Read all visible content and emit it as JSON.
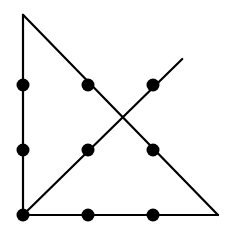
{
  "diagram": {
    "grid": {
      "rows": 3,
      "cols": 3
    },
    "dots": [
      {
        "row": 0,
        "col": 0
      },
      {
        "row": 0,
        "col": 1
      },
      {
        "row": 0,
        "col": 2
      },
      {
        "row": 1,
        "col": 0
      },
      {
        "row": 1,
        "col": 1
      },
      {
        "row": 1,
        "col": 2
      },
      {
        "row": 2,
        "col": 0
      },
      {
        "row": 2,
        "col": 1
      },
      {
        "row": 2,
        "col": 2
      }
    ],
    "path_in_grid_units": [
      {
        "col": 2.45,
        "row": -0.4
      },
      {
        "col": 0,
        "row": 2
      },
      {
        "col": 3.0,
        "row": 2
      },
      {
        "col": 0,
        "row": -1.08
      },
      {
        "col": 0,
        "row": 2
      }
    ],
    "line_count": 4,
    "color": "#000000"
  }
}
